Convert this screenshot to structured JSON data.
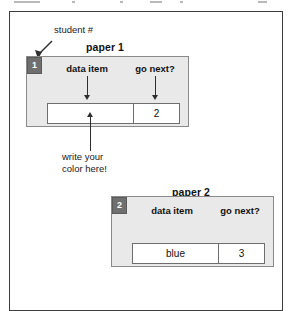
{
  "figure": {
    "outer_frame": true,
    "callout": {
      "student_number_label": "student #",
      "write_color_note_line1": "write your",
      "write_color_note_line2": "color here!"
    },
    "papers": [
      {
        "title": "paper 1",
        "badge": "1",
        "headers": {
          "data_item": "data item",
          "go_next": "go next?"
        },
        "row": {
          "data_item_value": "",
          "go_next_value": "2"
        }
      },
      {
        "title": "paper 2",
        "badge": "2",
        "headers": {
          "data_item": "data item",
          "go_next": "go next?"
        },
        "row": {
          "data_item_value": "blue",
          "go_next_value": "3"
        }
      }
    ]
  },
  "colors": {
    "panel_fill": "#e9e9e9",
    "panel_border": "#8a8a8a",
    "badge_fill": "#6f6f6f",
    "badge_text": "#ffffff",
    "frame_border": "#3d3d3d",
    "cell_fill": "#ffffff",
    "cell_border": "#6e6e6e",
    "arrow": "#2f2f2f",
    "text": "#111111"
  }
}
